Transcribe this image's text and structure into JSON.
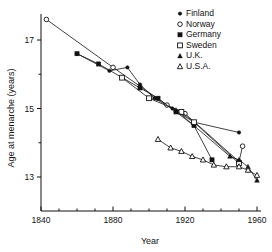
{
  "chart_data": {
    "type": "line",
    "title": "",
    "xlabel": "Year",
    "ylabel": "Age at menarche  (years)",
    "xlim": [
      1840,
      1960
    ],
    "ylim": [
      12.6,
      17.9
    ],
    "xticks": [
      1840,
      1880,
      1920,
      1960
    ],
    "xtick_labels": [
      "1840",
      "1880",
      "1920",
      "1960"
    ],
    "xminor_ticks": [
      1850,
      1860,
      1870,
      1890,
      1900,
      1910,
      1930,
      1940,
      1950
    ],
    "yticks": [
      13,
      15,
      17
    ],
    "ytick_labels": [
      "13",
      "15",
      "17"
    ],
    "yminor_ticks": [
      14,
      16
    ],
    "grid": false,
    "legend_position": "top-right",
    "series": [
      {
        "name": "Finland",
        "marker": "filled-circle",
        "color": "#111111",
        "points": [
          {
            "x": 1860,
            "y": 16.6
          },
          {
            "x": 1878,
            "y": 16.1
          },
          {
            "x": 1888,
            "y": 16.2
          },
          {
            "x": 1895,
            "y": 15.7
          },
          {
            "x": 1903,
            "y": 15.3
          },
          {
            "x": 1913,
            "y": 15.0
          },
          {
            "x": 1925,
            "y": 14.6
          },
          {
            "x": 1950,
            "y": 14.3
          }
        ]
      },
      {
        "name": "Norway",
        "marker": "open-circle",
        "color": "#111111",
        "points": [
          {
            "x": 1843,
            "y": 17.6
          },
          {
            "x": 1880,
            "y": 16.2
          },
          {
            "x": 1910,
            "y": 15.1
          },
          {
            "x": 1920,
            "y": 14.85
          },
          {
            "x": 1950,
            "y": 13.45
          },
          {
            "x": 1952,
            "y": 13.9
          }
        ]
      },
      {
        "name": "Germany",
        "marker": "filled-square",
        "color": "#111111",
        "points": [
          {
            "x": 1860,
            "y": 16.6
          },
          {
            "x": 1872,
            "y": 16.3
          },
          {
            "x": 1895,
            "y": 15.6
          },
          {
            "x": 1905,
            "y": 15.3
          },
          {
            "x": 1915,
            "y": 14.9
          },
          {
            "x": 1925,
            "y": 14.5
          },
          {
            "x": 1935,
            "y": 13.5
          }
        ]
      },
      {
        "name": "Sweden",
        "marker": "open-square",
        "color": "#111111",
        "points": [
          {
            "x": 1885,
            "y": 15.9
          },
          {
            "x": 1900,
            "y": 15.3
          },
          {
            "x": 1918,
            "y": 14.9
          },
          {
            "x": 1925,
            "y": 14.6
          },
          {
            "x": 1950,
            "y": 13.4
          }
        ]
      },
      {
        "name": "U.K.",
        "marker": "filled-triangle",
        "color": "#111111",
        "points": [
          {
            "x": 1915,
            "y": 14.95
          },
          {
            "x": 1945,
            "y": 13.6
          },
          {
            "x": 1950,
            "y": 13.5
          },
          {
            "x": 1955,
            "y": 13.3
          },
          {
            "x": 1960,
            "y": 12.9
          }
        ]
      },
      {
        "name": "U.S.A.",
        "marker": "open-triangle",
        "color": "#111111",
        "points": [
          {
            "x": 1905,
            "y": 14.1
          },
          {
            "x": 1912,
            "y": 13.85
          },
          {
            "x": 1918,
            "y": 13.75
          },
          {
            "x": 1924,
            "y": 13.6
          },
          {
            "x": 1930,
            "y": 13.5
          },
          {
            "x": 1936,
            "y": 13.35
          },
          {
            "x": 1943,
            "y": 13.3
          },
          {
            "x": 1950,
            "y": 13.3
          },
          {
            "x": 1955,
            "y": 13.2
          },
          {
            "x": 1960,
            "y": 13.05
          }
        ]
      }
    ]
  },
  "legend": {
    "items": [
      {
        "label": "Finland",
        "marker": "filled-circle"
      },
      {
        "label": "Norway",
        "marker": "open-circle"
      },
      {
        "label": "Germany",
        "marker": "filled-square"
      },
      {
        "label": "Sweden",
        "marker": "open-square"
      },
      {
        "label": "U.K.",
        "marker": "filled-triangle"
      },
      {
        "label": "U.S.A.",
        "marker": "open-triangle"
      }
    ]
  },
  "axes": {
    "x_title": "Year",
    "y_title": "Age at menarche  (years)"
  },
  "colors": {
    "ink": "#111111",
    "background": "#ffffff"
  }
}
